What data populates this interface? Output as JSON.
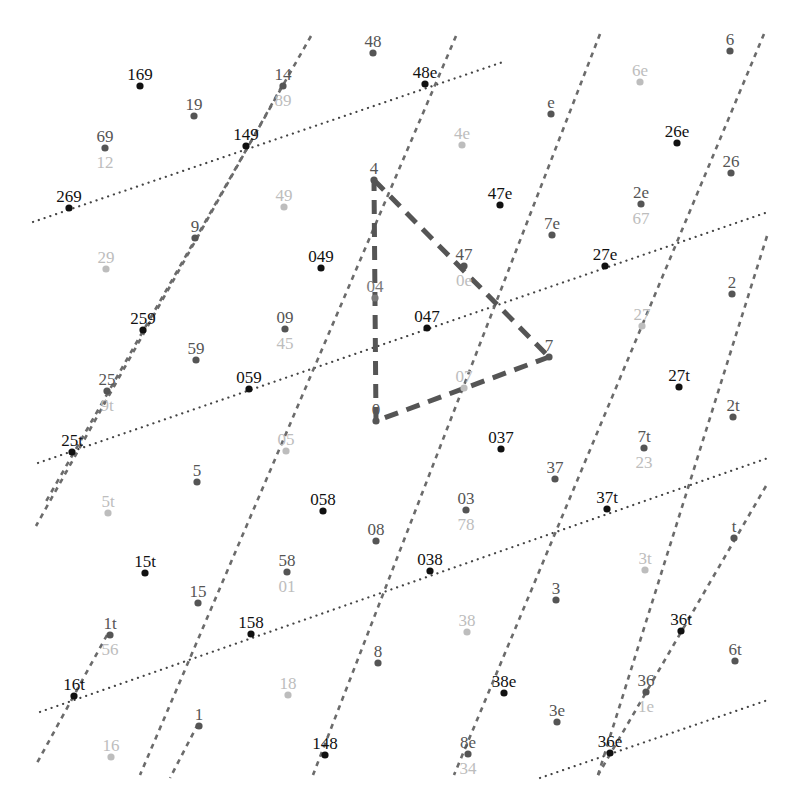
{
  "diagram": {
    "colors": {
      "black": "#111111",
      "dark": "#555555",
      "mid": "#7a7a7a",
      "light": "#bdbdbd",
      "dashed_line": "#6b6b6b",
      "dotted_line": "#444444",
      "triangle": "#555555"
    },
    "triangle": {
      "vertices": [
        {
          "label": "4",
          "x": 374,
          "y": 180
        },
        {
          "label": "7",
          "x": 549,
          "y": 357
        },
        {
          "label": "0",
          "x": 376,
          "y": 421
        }
      ]
    },
    "dashed_lines": [
      {
        "x1": 311,
        "y1": 36,
        "x2": 44,
        "y2": 505
      },
      {
        "x1": 456,
        "y1": 36,
        "x2": 140,
        "y2": 775
      },
      {
        "x1": 600,
        "y1": 34,
        "x2": 313,
        "y2": 775
      },
      {
        "x1": 764,
        "y1": 34,
        "x2": 454,
        "y2": 775
      },
      {
        "x1": 767,
        "y1": 236,
        "x2": 598,
        "y2": 775
      },
      {
        "x1": 766,
        "y1": 488,
        "x2": 36,
        "y2": 763
      },
      {
        "x1": 44,
        "y1": 505,
        "x2": 172,
        "y2": 775
      }
    ],
    "dashed_lines_ext": [
      {
        "x1": 282,
        "y1": 86,
        "x2": 36,
        "y2": 526
      },
      {
        "x1": 766,
        "y1": 486,
        "x2": 598,
        "y2": 775
      },
      {
        "x1": 107,
        "y1": 635,
        "x2": 37,
        "y2": 763
      },
      {
        "x1": 198,
        "y1": 724,
        "x2": 170,
        "y2": 778
      }
    ],
    "dotted_lines": [
      {
        "x1": 33,
        "y1": 222,
        "x2": 506,
        "y2": 61
      },
      {
        "x1": 38,
        "y1": 463,
        "x2": 768,
        "y2": 212
      },
      {
        "x1": 40,
        "y1": 712,
        "x2": 768,
        "y2": 458
      },
      {
        "x1": 540,
        "y1": 778,
        "x2": 768,
        "y2": 700
      }
    ],
    "points": [
      {
        "label": "169",
        "x": 140,
        "y": 86,
        "tone": "black"
      },
      {
        "label": "19",
        "x": 194,
        "y": 116,
        "tone": "dark"
      },
      {
        "label": "14",
        "x": 283,
        "y": 86,
        "tone": "dark"
      },
      {
        "label": "89",
        "x": 283,
        "y": 86,
        "tone": "light",
        "label_only": true,
        "ly": 106
      },
      {
        "label": "48",
        "x": 373,
        "y": 53,
        "tone": "dark"
      },
      {
        "label": "48e",
        "x": 425,
        "y": 84,
        "tone": "black"
      },
      {
        "label": "e",
        "x": 551,
        "y": 114,
        "tone": "dark"
      },
      {
        "label": "6",
        "x": 730,
        "y": 51,
        "tone": "dark"
      },
      {
        "label": "6e",
        "x": 640,
        "y": 82,
        "tone": "light"
      },
      {
        "label": "69",
        "x": 105,
        "y": 148,
        "tone": "dark"
      },
      {
        "label": "12",
        "x": 105,
        "y": 148,
        "tone": "light",
        "label_only": true,
        "ly": 168
      },
      {
        "label": "149",
        "x": 246,
        "y": 146,
        "tone": "black"
      },
      {
        "label": "4e",
        "x": 462,
        "y": 145,
        "tone": "light"
      },
      {
        "label": "26e",
        "x": 677,
        "y": 143,
        "tone": "black"
      },
      {
        "label": "26",
        "x": 731,
        "y": 173,
        "tone": "dark"
      },
      {
        "label": "269",
        "x": 69,
        "y": 208,
        "tone": "black"
      },
      {
        "label": "4",
        "x": 374,
        "y": 180,
        "tone": "dark"
      },
      {
        "label": "47e",
        "x": 500,
        "y": 205,
        "tone": "black"
      },
      {
        "label": "2e",
        "x": 641,
        "y": 204,
        "tone": "dark"
      },
      {
        "label": "67",
        "x": 641,
        "y": 204,
        "tone": "light",
        "label_only": true,
        "ly": 224
      },
      {
        "label": "7e",
        "x": 552,
        "y": 235,
        "tone": "dark"
      },
      {
        "label": "9",
        "x": 195,
        "y": 238,
        "tone": "dark"
      },
      {
        "label": "49",
        "x": 284,
        "y": 207,
        "tone": "light"
      },
      {
        "label": "049",
        "x": 321,
        "y": 268,
        "tone": "black"
      },
      {
        "label": "47",
        "x": 464,
        "y": 266,
        "tone": "dark"
      },
      {
        "label": "0e",
        "x": 464,
        "y": 266,
        "tone": "light",
        "label_only": true,
        "ly": 286
      },
      {
        "label": "27e",
        "x": 605,
        "y": 266,
        "tone": "black"
      },
      {
        "label": "29",
        "x": 106,
        "y": 269,
        "tone": "light"
      },
      {
        "label": "2",
        "x": 732,
        "y": 294,
        "tone": "dark"
      },
      {
        "label": "04",
        "x": 375,
        "y": 298,
        "tone": "mid"
      },
      {
        "label": "259",
        "x": 143,
        "y": 330,
        "tone": "black"
      },
      {
        "label": "09",
        "x": 285,
        "y": 329,
        "tone": "dark"
      },
      {
        "label": "45",
        "x": 285,
        "y": 329,
        "tone": "light",
        "label_only": true,
        "ly": 349
      },
      {
        "label": "047",
        "x": 427,
        "y": 328,
        "tone": "black"
      },
      {
        "label": "27",
        "x": 642,
        "y": 326,
        "tone": "light"
      },
      {
        "label": "59",
        "x": 196,
        "y": 360,
        "tone": "dark"
      },
      {
        "label": "7",
        "x": 549,
        "y": 357,
        "tone": "dark"
      },
      {
        "label": "27t",
        "x": 679,
        "y": 387,
        "tone": "black"
      },
      {
        "label": "25",
        "x": 107,
        "y": 391,
        "tone": "dark"
      },
      {
        "label": "9t",
        "x": 107,
        "y": 391,
        "tone": "light",
        "label_only": true,
        "ly": 411
      },
      {
        "label": "059",
        "x": 249,
        "y": 389,
        "tone": "black"
      },
      {
        "label": "07",
        "x": 464,
        "y": 388,
        "tone": "light"
      },
      {
        "label": "2t",
        "x": 733,
        "y": 417,
        "tone": "dark"
      },
      {
        "label": "0",
        "x": 376,
        "y": 421,
        "tone": "dark"
      },
      {
        "label": "037",
        "x": 501,
        "y": 449,
        "tone": "black"
      },
      {
        "label": "7t",
        "x": 644,
        "y": 448,
        "tone": "dark"
      },
      {
        "label": "23",
        "x": 644,
        "y": 448,
        "tone": "light",
        "label_only": true,
        "ly": 468
      },
      {
        "label": "25t",
        "x": 72,
        "y": 452,
        "tone": "black"
      },
      {
        "label": "05",
        "x": 286,
        "y": 451,
        "tone": "light"
      },
      {
        "label": "5",
        "x": 197,
        "y": 482,
        "tone": "dark"
      },
      {
        "label": "37",
        "x": 555,
        "y": 479,
        "tone": "dark"
      },
      {
        "label": "058",
        "x": 323,
        "y": 511,
        "tone": "black"
      },
      {
        "label": "03",
        "x": 466,
        "y": 510,
        "tone": "dark"
      },
      {
        "label": "78",
        "x": 466,
        "y": 510,
        "tone": "light",
        "label_only": true,
        "ly": 530
      },
      {
        "label": "37t",
        "x": 607,
        "y": 509,
        "tone": "black"
      },
      {
        "label": "5t",
        "x": 108,
        "y": 513,
        "tone": "light"
      },
      {
        "label": "08",
        "x": 376,
        "y": 541,
        "tone": "dark"
      },
      {
        "label": "t",
        "x": 734,
        "y": 538,
        "tone": "dark"
      },
      {
        "label": "15t",
        "x": 145,
        "y": 573,
        "tone": "black"
      },
      {
        "label": "58",
        "x": 287,
        "y": 572,
        "tone": "dark"
      },
      {
        "label": "01",
        "x": 287,
        "y": 572,
        "tone": "light",
        "label_only": true,
        "ly": 592
      },
      {
        "label": "038",
        "x": 430,
        "y": 571,
        "tone": "black"
      },
      {
        "label": "3t",
        "x": 645,
        "y": 570,
        "tone": "light"
      },
      {
        "label": "3",
        "x": 556,
        "y": 600,
        "tone": "dark"
      },
      {
        "label": "15",
        "x": 198,
        "y": 603,
        "tone": "dark"
      },
      {
        "label": "158",
        "x": 251,
        "y": 634,
        "tone": "black"
      },
      {
        "label": "36t",
        "x": 681,
        "y": 631,
        "tone": "black"
      },
      {
        "label": "1t",
        "x": 110,
        "y": 635,
        "tone": "dark"
      },
      {
        "label": "56",
        "x": 110,
        "y": 635,
        "tone": "light",
        "label_only": true,
        "ly": 655
      },
      {
        "label": "38",
        "x": 467,
        "y": 632,
        "tone": "light"
      },
      {
        "label": "8",
        "x": 378,
        "y": 663,
        "tone": "dark"
      },
      {
        "label": "6t",
        "x": 735,
        "y": 661,
        "tone": "dark"
      },
      {
        "label": "16t",
        "x": 74,
        "y": 696,
        "tone": "black"
      },
      {
        "label": "38e",
        "x": 504,
        "y": 693,
        "tone": "black"
      },
      {
        "label": "36",
        "x": 646,
        "y": 692,
        "tone": "dark"
      },
      {
        "label": "1e",
        "x": 646,
        "y": 692,
        "tone": "light",
        "label_only": true,
        "ly": 712
      },
      {
        "label": "18",
        "x": 288,
        "y": 695,
        "tone": "light"
      },
      {
        "label": "1",
        "x": 199,
        "y": 726,
        "tone": "dark"
      },
      {
        "label": "3e",
        "x": 557,
        "y": 722,
        "tone": "dark"
      },
      {
        "label": "148",
        "x": 325,
        "y": 755,
        "tone": "black"
      },
      {
        "label": "8e",
        "x": 468,
        "y": 754,
        "tone": "dark"
      },
      {
        "label": "34",
        "x": 468,
        "y": 754,
        "tone": "light",
        "label_only": true,
        "ly": 774
      },
      {
        "label": "36e",
        "x": 610,
        "y": 753,
        "tone": "black"
      },
      {
        "label": "16",
        "x": 111,
        "y": 757,
        "tone": "light"
      }
    ]
  }
}
